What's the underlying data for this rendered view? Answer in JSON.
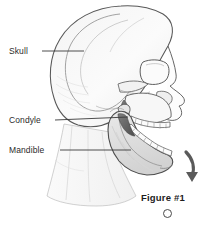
{
  "figure": {
    "caption": "Figure #1",
    "medium": "grayscale pencil line drawing",
    "background_color": "#ffffff",
    "line_color": "#3a3a3a",
    "shade_color": "#b8b8b8",
    "marker_icon": "empty-circle-marker"
  },
  "labels": [
    {
      "id": "skull",
      "text": "Skull",
      "leader": {
        "x1": 42,
        "y1": 51,
        "x2": 84,
        "y2": 51
      }
    },
    {
      "id": "condyle",
      "text": "Condyle",
      "leader": {
        "x1": 55,
        "y1": 120,
        "x2": 128,
        "y2": 117
      }
    },
    {
      "id": "mandible",
      "text": "Mandible",
      "leader": {
        "x1": 60,
        "y1": 150,
        "x2": 131,
        "y2": 150
      }
    }
  ],
  "annotations": [
    {
      "id": "motion-arrow",
      "name": "jaw-opening-arrow",
      "description": "curved arrow indicating downward rotation of the mandible",
      "color": "#5a5a5a"
    }
  ],
  "anatomy_parts": [
    "cranium",
    "frontal bone",
    "parietal bone",
    "temporal bone",
    "occipital bone",
    "orbital socket",
    "nasal aperture",
    "zygomatic arch",
    "maxilla",
    "maxillary teeth",
    "mandible",
    "mandibular teeth",
    "condyle",
    "coronoid process",
    "ramus",
    "mental protuberance",
    "neck contour"
  ]
}
